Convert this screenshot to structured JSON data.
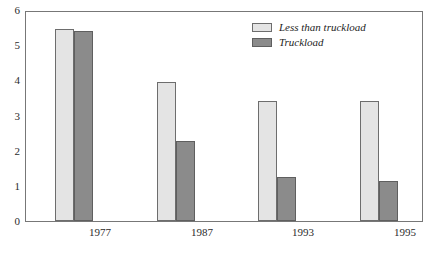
{
  "chart_data": {
    "type": "bar",
    "title": "",
    "subtitle": "",
    "xlabel": "",
    "ylabel": "",
    "categories": [
      "1977",
      "1987",
      "1993",
      "1995"
    ],
    "series": [
      {
        "name": "Less than truckload",
        "values": [
          5.5,
          4.0,
          3.45,
          3.45
        ],
        "color": "#e4e4e4"
      },
      {
        "name": "Truckload",
        "values": [
          5.45,
          2.3,
          1.27,
          1.15
        ],
        "color": "#8b8b8b"
      }
    ],
    "ylim": [
      0,
      6
    ],
    "yticks": [
      0,
      1,
      2,
      3,
      4,
      5,
      6
    ],
    "ytick_labels": [
      "0",
      "1",
      "2",
      "3",
      "4",
      "5",
      "6"
    ],
    "grid": false,
    "legend_position": "top-right"
  },
  "axes": {
    "y_labels": [
      "6",
      "5",
      "4",
      "3",
      "2",
      "1",
      "0"
    ],
    "x_labels": [
      "1977",
      "1987",
      "1993",
      "1995"
    ]
  },
  "legend": {
    "items": [
      {
        "label": "Less than truckload"
      },
      {
        "label": "Truckload"
      }
    ]
  },
  "colors": {
    "light_bar": "#e4e4e4",
    "dark_bar": "#8b8b8b",
    "frame": "#777777",
    "text": "#2b2b2b"
  }
}
